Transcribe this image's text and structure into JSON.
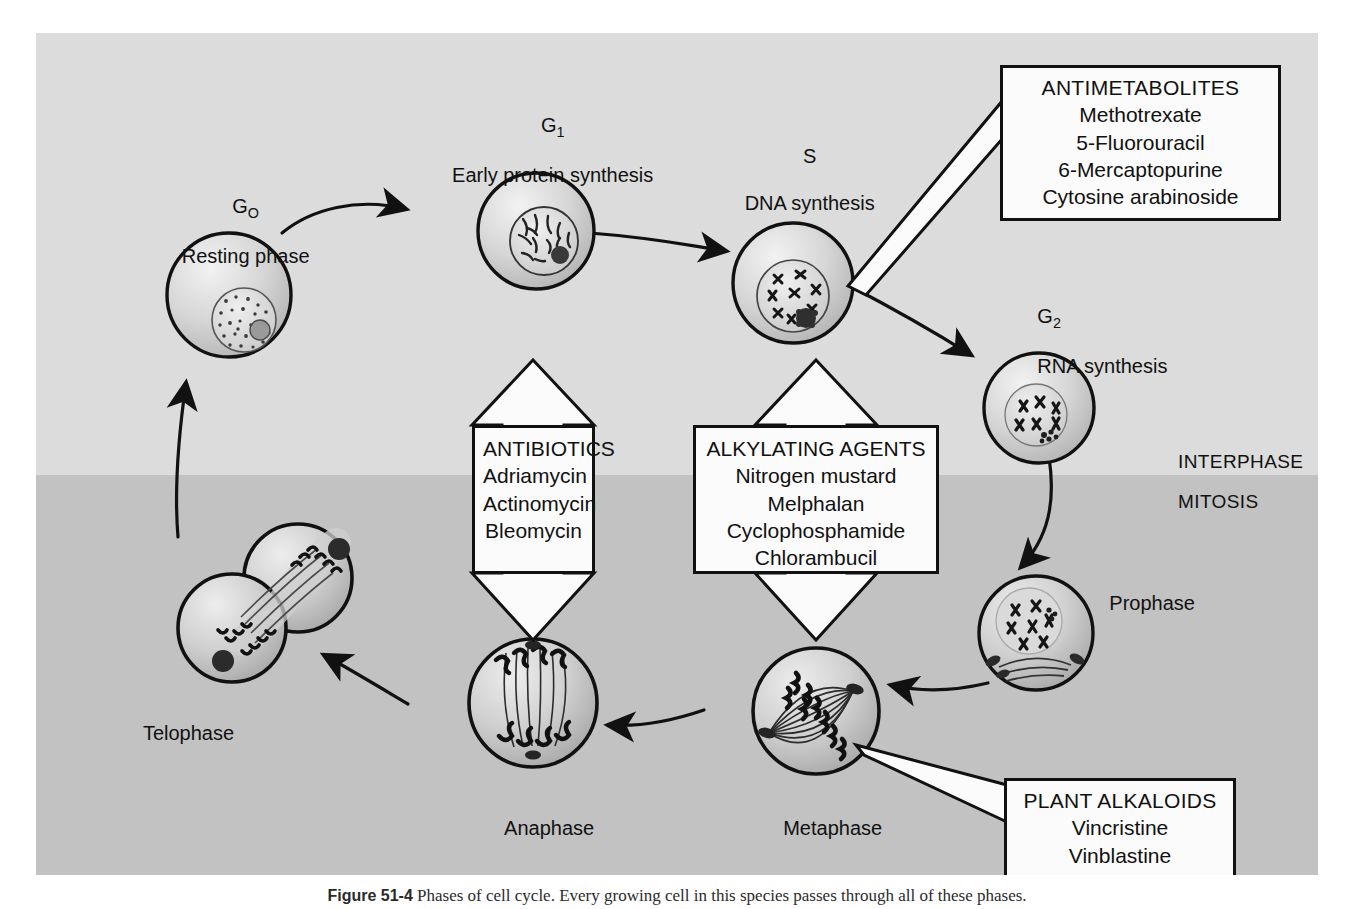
{
  "figure": {
    "caption_label": "Figure 51-4",
    "caption_text": "Phases of cell cycle. Every growing cell in this species passes through all of these phases.",
    "band_labels": {
      "interphase": "INTERPHASE",
      "mitosis": "MITOSIS"
    },
    "colors": {
      "plate_interphase": "#dcdcdc",
      "plate_mitosis": "#c2c2c2",
      "ink": "#111111",
      "box_fill": "#fbfbfb"
    }
  },
  "phases": {
    "g0": {
      "code": "G",
      "sub": "O",
      "name": "Resting phase"
    },
    "g1": {
      "code": "G",
      "sub": "1",
      "name": "Early protein synthesis"
    },
    "s": {
      "code": "S",
      "sub": "",
      "name": "DNA synthesis"
    },
    "g2": {
      "code": "G",
      "sub": "2",
      "name": "RNA synthesis"
    },
    "prophase": {
      "name": "Prophase"
    },
    "metaphase": {
      "name": "Metaphase"
    },
    "anaphase": {
      "name": "Anaphase"
    },
    "telophase": {
      "name": "Telophase"
    }
  },
  "drug_callouts": {
    "antimetabolites": {
      "title": "ANTIMETABOLITES",
      "items": [
        "Methotrexate",
        "5-Fluorouracil",
        "6-Mercaptopurine",
        "Cytosine arabinoside"
      ]
    },
    "plant_alkaloids": {
      "title": "PLANT ALKALOIDS",
      "items": [
        "Vincristine",
        "Vinblastine"
      ]
    },
    "antibiotics": {
      "title": "ANTIBIOTICS",
      "items": [
        "Adriamycin",
        "Actinomycin",
        "Bleomycin"
      ]
    },
    "alkylating_agents": {
      "title": "ALKYLATING AGENTS",
      "items": [
        "Nitrogen mustard",
        "Melphalan",
        "Cyclophosphamide",
        "Chlorambucil"
      ]
    }
  }
}
